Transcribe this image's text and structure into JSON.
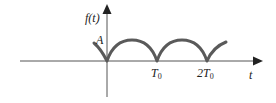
{
  "diagram": {
    "type": "periodic-signal-plot",
    "y_axis_label": "f(t)",
    "x_axis_label": "t",
    "amplitude_label": "A",
    "tick_labels": [
      {
        "text": "T",
        "sub": "0"
      },
      {
        "text": "2T",
        "sub": "0"
      }
    ],
    "colors": {
      "axis": "#444444",
      "curve": "#555555",
      "text": "#222222"
    }
  }
}
